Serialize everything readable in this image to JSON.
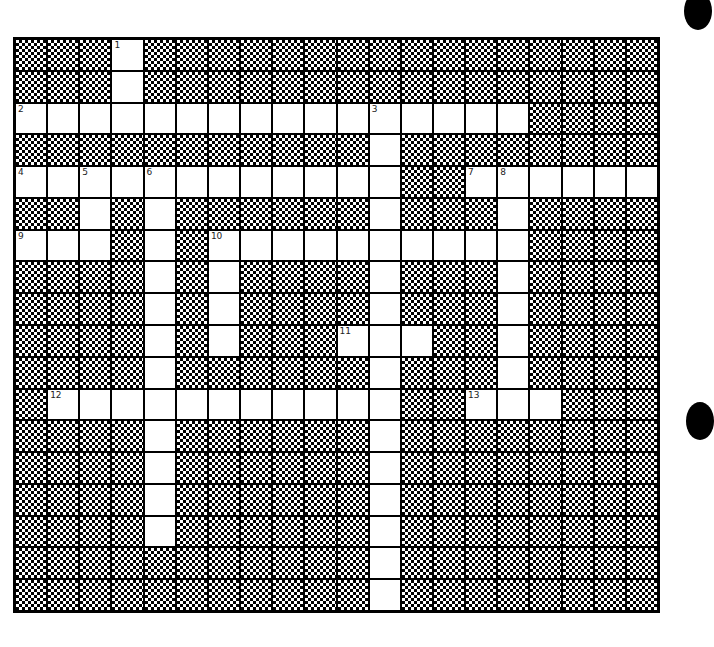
{
  "puzzle": {
    "cols": 20,
    "rows": 18,
    "colors": {
      "white_cell": "#ffffff",
      "black_cell_pattern": "#000000"
    },
    "white_cells": {
      "0": [
        3
      ],
      "1": [
        3
      ],
      "2": [
        0,
        1,
        2,
        3,
        4,
        5,
        6,
        7,
        8,
        9,
        10,
        11,
        12,
        13,
        14,
        15
      ],
      "3": [
        11
      ],
      "4": [
        0,
        1,
        2,
        3,
        4,
        5,
        6,
        7,
        8,
        9,
        10,
        11,
        14,
        15,
        16,
        17,
        18,
        19
      ],
      "5": [
        2,
        4,
        11,
        15
      ],
      "6": [
        0,
        1,
        2,
        4,
        6,
        7,
        8,
        9,
        10,
        11,
        12,
        13,
        14,
        15
      ],
      "7": [
        4,
        6,
        11,
        15
      ],
      "8": [
        4,
        6,
        11,
        15
      ],
      "9": [
        4,
        6,
        10,
        11,
        12,
        15
      ],
      "10": [
        4,
        11,
        15
      ],
      "11": [
        1,
        2,
        3,
        4,
        5,
        6,
        7,
        8,
        9,
        10,
        11,
        14,
        15,
        16
      ],
      "12": [
        4,
        11
      ],
      "13": [
        4,
        11
      ],
      "14": [
        4,
        11
      ],
      "15": [
        4,
        11
      ],
      "16": [
        11
      ],
      "17": [
        11
      ]
    },
    "numbers": [
      {
        "n": "1",
        "row": 0,
        "col": 3
      },
      {
        "n": "2",
        "row": 2,
        "col": 0
      },
      {
        "n": "3",
        "row": 2,
        "col": 11
      },
      {
        "n": "4",
        "row": 4,
        "col": 0
      },
      {
        "n": "5",
        "row": 4,
        "col": 2
      },
      {
        "n": "6",
        "row": 4,
        "col": 4
      },
      {
        "n": "7",
        "row": 4,
        "col": 14
      },
      {
        "n": "8",
        "row": 4,
        "col": 15
      },
      {
        "n": "9",
        "row": 6,
        "col": 0
      },
      {
        "n": "10",
        "row": 6,
        "col": 6
      },
      {
        "n": "11",
        "row": 9,
        "col": 10
      },
      {
        "n": "12",
        "row": 11,
        "col": 1
      },
      {
        "n": "13",
        "row": 11,
        "col": 14
      }
    ]
  },
  "decorations": {
    "hole_punches": [
      {
        "x": 684,
        "y": -8
      },
      {
        "x": 686,
        "y": 402
      }
    ]
  }
}
